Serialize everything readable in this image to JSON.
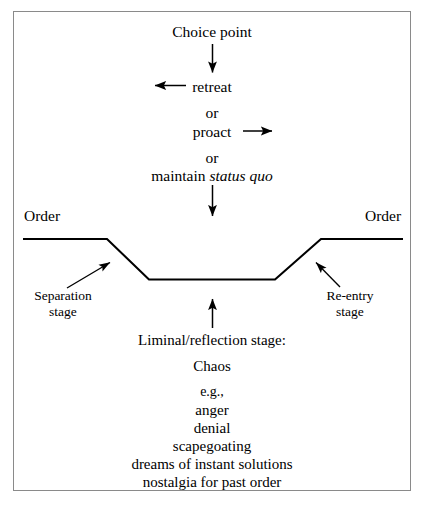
{
  "diagram": {
    "title_note": "Liminal / reflection stage diagram",
    "frame": {
      "border_color": "#8a8a8a"
    },
    "line_color": "#000000",
    "top_flow": {
      "choice_point": "Choice point",
      "options": [
        {
          "label": "retreat",
          "arrow": "left-arrow"
        },
        {
          "label": "or",
          "arrow": null
        },
        {
          "label": "proact",
          "arrow": "right-arrow"
        },
        {
          "label": "or",
          "arrow": null
        },
        {
          "label_plain": "maintain ",
          "label_italic": "status quo"
        }
      ]
    },
    "order_left": "Order",
    "order_right": "Order",
    "separation_stage": {
      "line1": "Separation",
      "line2": "stage"
    },
    "reentry_stage": {
      "line1": "Re-entry",
      "line2": "stage"
    },
    "liminal": {
      "heading": "Liminal/reflection stage:",
      "chaos": "Chaos",
      "eg": "e.g.,",
      "examples": [
        "anger",
        "denial",
        "scapegoating",
        "dreams of instant solutions",
        "nostalgia for past order"
      ]
    }
  }
}
